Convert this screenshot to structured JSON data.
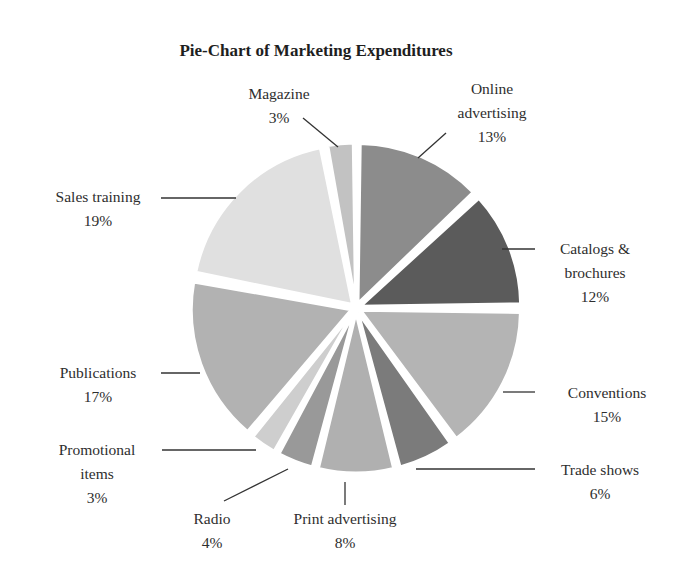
{
  "chart_data": {
    "type": "pie",
    "title": "Pie-Chart of Marketing Expenditures",
    "start_angle_deg": 0,
    "direction": "clockwise",
    "exploded": true,
    "center": [
      356,
      308
    ],
    "radius": 160,
    "explode_offset": 5,
    "slices": [
      {
        "label": "Online advertising",
        "label_lines": [
          "Online",
          "advertising",
          "13%"
        ],
        "value": 13,
        "pct_text": "13%",
        "color": "#8c8c8c",
        "label_pos": [
          492,
          94
        ],
        "anchor": "middle",
        "leader": [
          [
            418,
            158
          ],
          [
            446,
            133
          ]
        ]
      },
      {
        "label": "Catalogs & brochures",
        "label_lines": [
          "Catalogs &",
          "brochures",
          "12%"
        ],
        "value": 12,
        "pct_text": "12%",
        "color": "#5b5b5b",
        "label_pos": [
          595,
          254
        ],
        "anchor": "middle",
        "leader": [
          [
            502,
            249
          ],
          [
            535,
            249
          ]
        ]
      },
      {
        "label": "Conventions",
        "label_lines": [
          "Conventions",
          "15%"
        ],
        "value": 15,
        "pct_text": "15%",
        "color": "#b4b4b4",
        "label_pos": [
          607,
          398
        ],
        "anchor": "middle",
        "leader": [
          [
            503,
            392
          ],
          [
            535,
            392
          ]
        ]
      },
      {
        "label": "Trade shows",
        "label_lines": [
          "Trade shows",
          "6%"
        ],
        "value": 6,
        "pct_text": "6%",
        "color": "#7b7b7b",
        "label_pos": [
          600,
          475
        ],
        "anchor": "middle",
        "leader": [
          [
            416,
            469
          ],
          [
            535,
            469
          ]
        ]
      },
      {
        "label": "Print advertising",
        "label_lines": [
          "Print advertising",
          "8%"
        ],
        "value": 8,
        "pct_text": "8%",
        "color": "#b0b0b0",
        "label_pos": [
          345,
          524
        ],
        "anchor": "middle",
        "leader": [
          [
            345,
            482
          ],
          [
            345,
            505
          ]
        ]
      },
      {
        "label": "Radio",
        "label_lines": [
          "Radio",
          "4%"
        ],
        "value": 4,
        "pct_text": "4%",
        "color": "#999999",
        "label_pos": [
          212,
          524
        ],
        "anchor": "middle",
        "leader": [
          [
            288,
            469
          ],
          [
            224,
            501
          ]
        ]
      },
      {
        "label": "Promotional items",
        "label_lines": [
          "Promotional",
          "items",
          "3%"
        ],
        "value": 3,
        "pct_text": "3%",
        "color": "#cecece",
        "label_pos": [
          97,
          455
        ],
        "anchor": "middle",
        "leader": [
          [
            162,
            450
          ],
          [
            256,
            450
          ]
        ]
      },
      {
        "label": "Publications",
        "label_lines": [
          "Publications",
          "17%"
        ],
        "value": 17,
        "pct_text": "17%",
        "color": "#b2b2b2",
        "label_pos": [
          98,
          378
        ],
        "anchor": "middle",
        "leader": [
          [
            161,
            373
          ],
          [
            200,
            373
          ]
        ]
      },
      {
        "label": "Sales training",
        "label_lines": [
          "Sales training",
          "19%"
        ],
        "value": 19,
        "pct_text": "19%",
        "color": "#e0e0e0",
        "label_pos": [
          98,
          202
        ],
        "anchor": "middle",
        "leader": [
          [
            161,
            198
          ],
          [
            236,
            198
          ]
        ]
      },
      {
        "label": "Magazine",
        "label_lines": [
          "Magazine",
          "3%"
        ],
        "value": 3,
        "pct_text": "3%",
        "color": "#c2c2c2",
        "label_pos": [
          279,
          99
        ],
        "anchor": "middle",
        "leader": [
          [
            303,
            118
          ],
          [
            338,
            147
          ]
        ]
      }
    ]
  },
  "title_pos": [
    316,
    56
  ]
}
